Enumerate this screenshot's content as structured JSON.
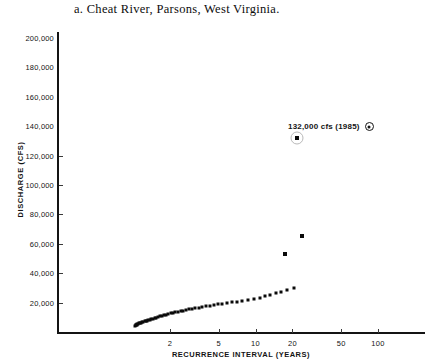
{
  "figure": {
    "label": "a.",
    "title": "a.  Cheat River, Parsons, West Virginia."
  },
  "annotation": {
    "text": "132,000 cfs (1985)",
    "marker_name": "circled-dot-marker"
  },
  "chart_data": {
    "type": "scatter",
    "title": "a.  Cheat River, Parsons, West Virginia.",
    "xlabel": "RECURRENCE INTERVAL (YEARS)",
    "ylabel": "DISCHARGE (CFS)",
    "xscale": "log-probability",
    "yscale": "linear",
    "ylim": [
      0,
      200000
    ],
    "xlim": [
      1.02,
      200
    ],
    "grid": false,
    "legend": "none",
    "ytick_labels": [
      "200,000",
      "180,000",
      "160,000",
      "140,000",
      "120,000",
      "100,000",
      "80,000",
      "60,000",
      "40,000",
      "20,000"
    ],
    "ytick_values": [
      200000,
      180000,
      160000,
      140000,
      120000,
      100000,
      80000,
      60000,
      40000,
      20000
    ],
    "xtick_labels": [
      "2",
      "5",
      "10",
      "20",
      "50",
      "100"
    ],
    "xtick_values": [
      2,
      5,
      10,
      20,
      50,
      100
    ],
    "annotations": [
      {
        "text": "132,000 cfs (1985)",
        "x": 22,
        "y": 132000,
        "marker": "circled-dot"
      }
    ],
    "series": [
      {
        "name": "Annual peak discharge",
        "marker": "filled-square",
        "points": [
          [
            1.04,
            4200
          ],
          [
            1.05,
            4600
          ],
          [
            1.06,
            4900
          ],
          [
            1.07,
            5100
          ],
          [
            1.08,
            5300
          ],
          [
            1.1,
            5600
          ],
          [
            1.12,
            5900
          ],
          [
            1.14,
            6100
          ],
          [
            1.16,
            6400
          ],
          [
            1.18,
            6600
          ],
          [
            1.21,
            6900
          ],
          [
            1.24,
            7200
          ],
          [
            1.27,
            7500
          ],
          [
            1.3,
            7800
          ],
          [
            1.33,
            8100
          ],
          [
            1.37,
            8400
          ],
          [
            1.41,
            8700
          ],
          [
            1.45,
            9000
          ],
          [
            1.5,
            9400
          ],
          [
            1.55,
            9800
          ],
          [
            1.6,
            10200
          ],
          [
            1.66,
            10600
          ],
          [
            1.72,
            11000
          ],
          [
            1.79,
            11400
          ],
          [
            1.86,
            11800
          ],
          [
            1.94,
            12200
          ],
          [
            2.02,
            12600
          ],
          [
            2.11,
            13000
          ],
          [
            2.21,
            13400
          ],
          [
            2.32,
            13800
          ],
          [
            2.44,
            14200
          ],
          [
            2.57,
            14600
          ],
          [
            2.71,
            15000
          ],
          [
            2.87,
            15400
          ],
          [
            3.04,
            15800
          ],
          [
            3.23,
            16200
          ],
          [
            3.44,
            16600
          ],
          [
            3.67,
            17000
          ],
          [
            3.93,
            17500
          ],
          [
            4.22,
            17900
          ],
          [
            4.55,
            18300
          ],
          [
            4.92,
            18800
          ],
          [
            5.34,
            19200
          ],
          [
            5.82,
            19700
          ],
          [
            6.37,
            20200
          ],
          [
            7.01,
            20700
          ],
          [
            7.76,
            21200
          ],
          [
            8.64,
            21800
          ],
          [
            9.7,
            22400
          ],
          [
            10.9,
            23100
          ],
          [
            12.0,
            24200
          ],
          [
            13.2,
            25200
          ],
          [
            14.6,
            26300
          ],
          [
            16.2,
            27400
          ],
          [
            18.0,
            28600
          ],
          [
            20.5,
            29800
          ],
          [
            17.5,
            53000
          ],
          [
            24.0,
            65000
          ],
          [
            22.0,
            132000
          ]
        ]
      }
    ],
    "highlighted_point": {
      "x": 22,
      "y": 132000,
      "label": "132,000 cfs (1985)",
      "ring": true
    }
  },
  "colors": {
    "axis": "#141414",
    "point": "#0a0a0a",
    "ring": "#b9b9b9",
    "background": "#ffffff"
  }
}
